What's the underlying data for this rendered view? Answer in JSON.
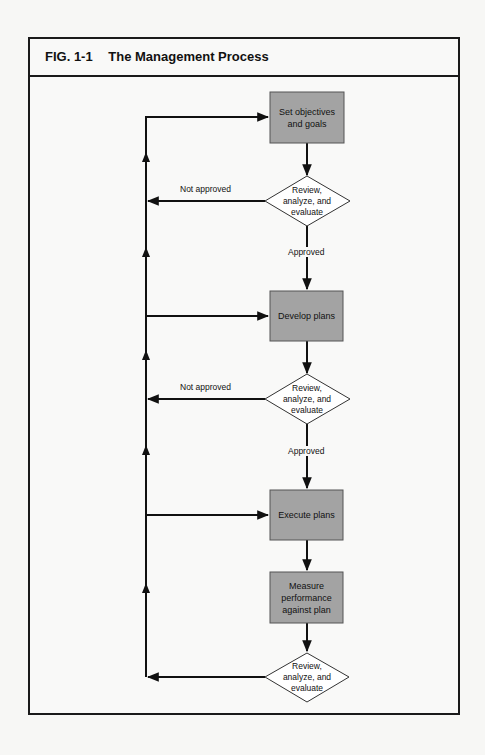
{
  "figure": {
    "number": "FIG. 1-1",
    "title": "The Management Process"
  },
  "colors": {
    "box_fill": "#a3a3a3",
    "line": "#111111",
    "diamond_fill": "#ffffff"
  },
  "nodes": {
    "set_objectives": {
      "type": "process",
      "label": "Set objectives and goals"
    },
    "review_1": {
      "type": "decision",
      "label": "Review, analyze, and evaluate"
    },
    "develop_plans": {
      "type": "process",
      "label": "Develop plans"
    },
    "review_2": {
      "type": "decision",
      "label": "Review, analyze, and evaluate"
    },
    "execute_plans": {
      "type": "process",
      "label": "Execute plans"
    },
    "measure_performance": {
      "type": "process",
      "label": "Measure performance against plan"
    },
    "review_3": {
      "type": "decision",
      "label": "Review, analyze, and evaluate"
    }
  },
  "edges": {
    "review_1_no": {
      "from": "review_1",
      "to": "feedback_loop",
      "label": "Not approved"
    },
    "review_1_yes": {
      "from": "review_1",
      "to": "develop_plans",
      "label": "Approved"
    },
    "review_2_no": {
      "from": "review_2",
      "to": "feedback_loop",
      "label": "Not approved"
    },
    "review_2_yes": {
      "from": "review_2",
      "to": "execute_plans",
      "label": "Approved"
    },
    "set_to_review": {
      "from": "set_objectives",
      "to": "review_1",
      "label": ""
    },
    "develop_to_review": {
      "from": "develop_plans",
      "to": "review_2",
      "label": ""
    },
    "execute_to_measure": {
      "from": "execute_plans",
      "to": "measure_performance",
      "label": ""
    },
    "measure_to_review": {
      "from": "measure_performance",
      "to": "review_3",
      "label": ""
    },
    "review_3_back": {
      "from": "review_3",
      "to": "feedback_loop",
      "label": ""
    },
    "loop_to_set": {
      "from": "feedback_loop",
      "to": "set_objectives",
      "label": ""
    },
    "loop_to_develop": {
      "from": "feedback_loop",
      "to": "develop_plans",
      "label": ""
    },
    "loop_to_execute": {
      "from": "feedback_loop",
      "to": "execute_plans",
      "label": ""
    }
  }
}
